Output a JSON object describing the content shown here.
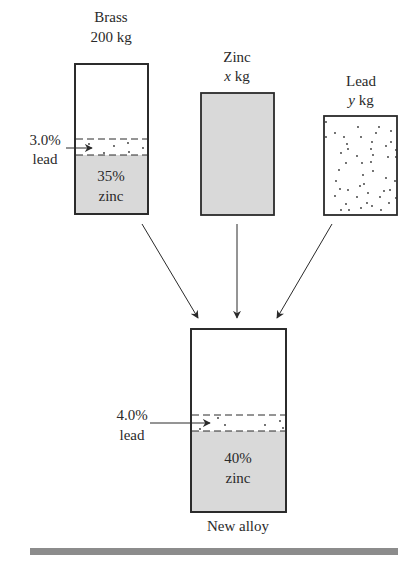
{
  "diagram": {
    "type": "mixture-flow",
    "colors": {
      "outline": "#2a2a2a",
      "zinc_fill": "#d9d9d9",
      "background": "#ffffff",
      "bottom_rule": "#8c8c8c",
      "dots": "#333333"
    },
    "sources": [
      {
        "id": "brass",
        "title": "Brass",
        "qty_value": "200",
        "qty_unit": "kg",
        "qty_italic": false,
        "composition": {
          "lead_label_pct": "3.0%",
          "lead_label_name": "lead",
          "zinc_label_pct": "35%",
          "zinc_label_name": "zinc"
        }
      },
      {
        "id": "zinc",
        "title": "Zinc",
        "qty_value": "x",
        "qty_unit": "kg",
        "qty_italic": true
      },
      {
        "id": "lead",
        "title": "Lead",
        "qty_value": "y",
        "qty_unit": "kg",
        "qty_italic": true
      }
    ],
    "result": {
      "id": "new-alloy",
      "title": "New alloy",
      "composition": {
        "lead_label_pct": "4.0%",
        "lead_label_name": "lead",
        "zinc_label_pct": "40%",
        "zinc_label_name": "zinc"
      }
    }
  }
}
